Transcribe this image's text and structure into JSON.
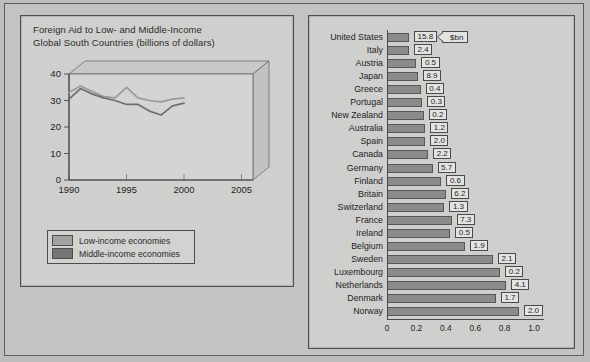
{
  "colors": {
    "page_background": "#bdbdbb",
    "panel_background": "#cfcfcd",
    "frame_border": "#4f4f4d",
    "bar_fill": "#8b8b89",
    "low_income_line": "#9a9a98",
    "middle_income_line": "#6f6f6d"
  },
  "left_panel": {
    "title_line1": "Foreign Aid to Low- and Middle-Income",
    "title_line2": "Global South Countries (billions of dollars)",
    "legend": [
      {
        "label": "Low-income economies",
        "color": "#a2a2a0"
      },
      {
        "label": "Middle-income economies",
        "color": "#757573"
      }
    ]
  },
  "right_panel": {
    "callout_label": "$bn"
  },
  "chart_data": [
    {
      "type": "line",
      "title": "Foreign Aid to Low- and Middle-Income Global South Countries (billions of dollars)",
      "xlabel": "",
      "ylabel": "",
      "xlim": [
        1990,
        2006
      ],
      "ylim": [
        0,
        40
      ],
      "xticks": [
        1990,
        1995,
        2000,
        2005
      ],
      "xtick_labels": [
        "1990",
        "1995",
        "2000",
        "2005"
      ],
      "yticks": [
        0,
        10,
        20,
        30,
        40
      ],
      "ytick_labels": [
        "0",
        "10",
        "20",
        "30",
        "40"
      ],
      "grid": false,
      "legend_position": "below-left",
      "x": [
        1990,
        1991,
        1992,
        1993,
        1994,
        1995,
        1996,
        1997,
        1998,
        1999,
        2000
      ],
      "series": [
        {
          "name": "Low-income economies",
          "values": [
            33.0,
            35.5,
            33.5,
            31.5,
            31.0,
            35.0,
            31.0,
            30.0,
            29.5,
            30.5,
            31.0
          ]
        },
        {
          "name": "Middle-income economies",
          "values": [
            30.5,
            34.5,
            32.5,
            31.0,
            30.0,
            28.5,
            28.5,
            26.0,
            24.5,
            28.0,
            29.0
          ]
        }
      ]
    },
    {
      "type": "bar",
      "orientation": "horizontal",
      "title": "",
      "xlabel": "",
      "ylabel": "",
      "xlim": [
        0,
        1.04
      ],
      "xticks": [
        0,
        0.2,
        0.4,
        0.6,
        0.8,
        1.0
      ],
      "xtick_labels": [
        "0",
        "0.2",
        "0.4",
        "0.6",
        "0.8",
        "1.0"
      ],
      "grid": false,
      "value_label_note": "$bn",
      "categories": [
        "United States",
        "Italy",
        "Austria",
        "Japan",
        "Greece",
        "Portugal",
        "New Zealand",
        "Australia",
        "Spain",
        "Canada",
        "Germany",
        "Finland",
        "Britain",
        "Switzerland",
        "France",
        "Ireland",
        "Belgium",
        "Sweden",
        "Luxembourg",
        "Netherlands",
        "Denmark",
        "Norway"
      ],
      "values": [
        0.15,
        0.15,
        0.2,
        0.21,
        0.23,
        0.24,
        0.25,
        0.26,
        0.26,
        0.28,
        0.31,
        0.37,
        0.4,
        0.39,
        0.44,
        0.43,
        0.53,
        0.72,
        0.77,
        0.81,
        0.74,
        0.9
      ],
      "bar_labels": [
        "15.8",
        "2.4",
        "0.5",
        "8.9",
        "0.4",
        "0.3",
        "0.2",
        "1.2",
        "2.0",
        "2.2",
        "5.7",
        "0.6",
        "6.2",
        "1.3",
        "7.3",
        "0.5",
        "1.9",
        "2.1",
        "0.2",
        "4.1",
        "1.7",
        "2.0"
      ]
    }
  ]
}
